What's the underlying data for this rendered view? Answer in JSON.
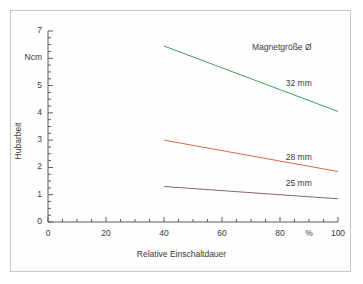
{
  "chart_data": {
    "type": "line",
    "title": "",
    "xlabel": "Relative Einschaltdauer",
    "ylabel": "Hubarbeit",
    "yunit": "Ncm",
    "xunit": "%",
    "xlim": [
      0,
      100
    ],
    "ylim": [
      0,
      7
    ],
    "grid": false,
    "legend_position": "inline-right",
    "legend_title": "Magnetgröße Ø",
    "x_major_ticks": [
      0,
      20,
      40,
      60,
      80,
      100
    ],
    "x_tick_labels": [
      "0",
      "20",
      "40",
      "60",
      "80",
      "100"
    ],
    "x_unit_tick": 90,
    "x_unit_tick_label": "%",
    "x_minor_step": 5,
    "y_major_ticks": [
      0,
      1,
      2,
      3,
      4,
      5,
      6,
      7
    ],
    "y_tick_labels": [
      "0",
      "1",
      "2",
      "3",
      "4",
      "5",
      "Ncm",
      "7"
    ],
    "y_minor_step": 0.25,
    "series": [
      {
        "name": "32 mm",
        "color": "#3f9c62",
        "x": [
          40,
          100
        ],
        "values": [
          6.45,
          4.05
        ],
        "label_x": 82,
        "label_y": 5.05
      },
      {
        "name": "28 mm",
        "color": "#d4694a",
        "x": [
          40,
          100
        ],
        "values": [
          3.0,
          1.85
        ],
        "label_x": 82,
        "label_y": 2.35
      },
      {
        "name": "25 mm",
        "color": "#8c6073",
        "x": [
          40,
          100
        ],
        "values": [
          1.3,
          0.85
        ],
        "label_x": 82,
        "label_y": 1.4
      }
    ]
  },
  "colors": {
    "axis": "#5a5a5a",
    "text": "#3a3a3a",
    "frame": "#c9c9c9",
    "background": "#ffffff"
  }
}
